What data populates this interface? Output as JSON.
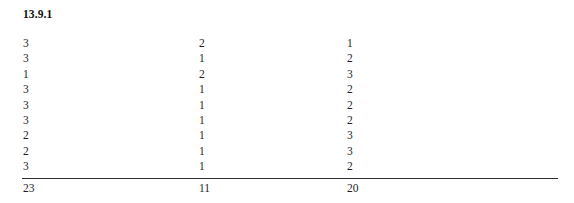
{
  "document": {
    "heading": "13.9.1"
  },
  "table": {
    "rows": [
      {
        "c0": "3",
        "c1": "2",
        "c2": "1"
      },
      {
        "c0": "3",
        "c1": "1",
        "c2": "2"
      },
      {
        "c0": "1",
        "c1": "2",
        "c2": "3"
      },
      {
        "c0": "3",
        "c1": "1",
        "c2": "2"
      },
      {
        "c0": "3",
        "c1": "1",
        "c2": "2"
      },
      {
        "c0": "3",
        "c1": "1",
        "c2": "2"
      },
      {
        "c0": "2",
        "c1": "1",
        "c2": "3"
      },
      {
        "c0": "2",
        "c1": "1",
        "c2": "3"
      },
      {
        "c0": "3",
        "c1": "1",
        "c2": "2"
      }
    ],
    "totals": {
      "c0": "23",
      "c1": "11",
      "c2": "20"
    }
  }
}
